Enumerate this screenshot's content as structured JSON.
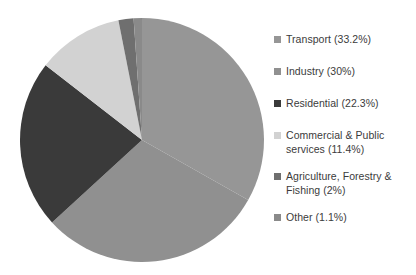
{
  "chart_data": {
    "type": "pie",
    "title": "",
    "subtitle": "",
    "xlabel": "",
    "ylabel": "",
    "legend_position": "right",
    "grid": false,
    "start_angle_deg": 0,
    "direction": "clockwise",
    "categories": [
      "Transport",
      "Industry",
      "Residential",
      "Commercial & Public services",
      "Agriculture, Forestry & Fishing",
      "Other"
    ],
    "values": [
      33.2,
      30,
      22.3,
      11.4,
      2,
      1.1
    ],
    "value_unit": "%",
    "slices": [
      {
        "label": "Transport",
        "value": 33.2,
        "value_text": "33.2%",
        "color": "#969696"
      },
      {
        "label": "Industry",
        "value": 30,
        "value_text": "30%",
        "color": "#909090"
      },
      {
        "label": "Residential",
        "value": 22.3,
        "value_text": "22.3%",
        "color": "#3a3a3a"
      },
      {
        "label": "Commercial & Public services",
        "value": 11.4,
        "value_text": "11.4%",
        "color": "#d2d2d2"
      },
      {
        "label": "Agriculture, Forestry & Fishing",
        "value": 2,
        "value_text": "2%",
        "color": "#6f6f6f"
      },
      {
        "label": "Other",
        "value": 1.1,
        "value_text": "1.1%",
        "color": "#8a8a8a"
      }
    ],
    "legend": [
      {
        "text": "Transport (33.2%)",
        "color": "#969696"
      },
      {
        "text": "Industry (30%)",
        "color": "#909090"
      },
      {
        "text": "Residential (22.3%)",
        "color": "#3a3a3a"
      },
      {
        "text": "Commercial & Public\nservices (11.4%)",
        "color": "#d2d2d2"
      },
      {
        "text": "Agriculture, Forestry &\nFishing (2%)",
        "color": "#6f6f6f"
      },
      {
        "text": "Other (1.1%)",
        "color": "#8a8a8a"
      }
    ]
  },
  "colors": {
    "background": "#ffffff",
    "text": "#3b3b3b",
    "transport": "#969696",
    "industry": "#909090",
    "residential": "#3a3a3a",
    "commercial": "#d2d2d2",
    "agriculture": "#6f6f6f",
    "other": "#8a8a8a"
  }
}
